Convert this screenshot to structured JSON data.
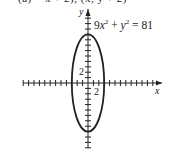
{
  "header": {
    "cut_off_text": "(a)  = x + 2), (x, y + 2)"
  },
  "chart_data": {
    "type": "line",
    "title": "",
    "equation": "9x² + y² = 81",
    "curve": "ellipse",
    "center": [
      0,
      0
    ],
    "semi_axis_x": 3,
    "semi_axis_y": 9,
    "xlabel": "x",
    "ylabel": "y",
    "tick_label_x": "2",
    "tick_label_y": "2",
    "xlim": [
      -12,
      13
    ],
    "ylim": [
      -12,
      13
    ],
    "tick_spacing": 1,
    "grid": false,
    "legend": "none"
  },
  "colors": {
    "ink": "#222222",
    "background": "#ffffff"
  }
}
